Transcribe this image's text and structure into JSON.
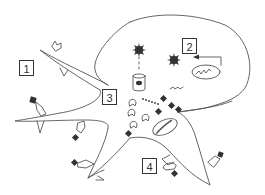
{
  "diagram": {
    "type": "cell-schematic",
    "colors": {
      "outline": "#555555",
      "dark_fill": "#333333",
      "background": "#ffffff"
    },
    "labels": [
      {
        "id": "1",
        "text": "1",
        "x": 19,
        "y": 60
      },
      {
        "id": "2",
        "text": "2",
        "x": 182,
        "y": 38
      },
      {
        "id": "3",
        "text": "3",
        "x": 102,
        "y": 89
      },
      {
        "id": "4",
        "text": "4",
        "x": 142,
        "y": 158
      }
    ],
    "components": [
      "cell-body-outline",
      "upper-left-process",
      "left-process",
      "lower-left-process",
      "lower-right-process",
      "spiky-particle-top",
      "spiky-particle-right",
      "cylinder-vesicle",
      "organelle-with-squiggle",
      "signal-arrow-to-label-2",
      "small-squiggle",
      "dotted-line-particles",
      "open-receptors",
      "receptor-with-bound-ligand",
      "oval-organelle-lower"
    ]
  }
}
